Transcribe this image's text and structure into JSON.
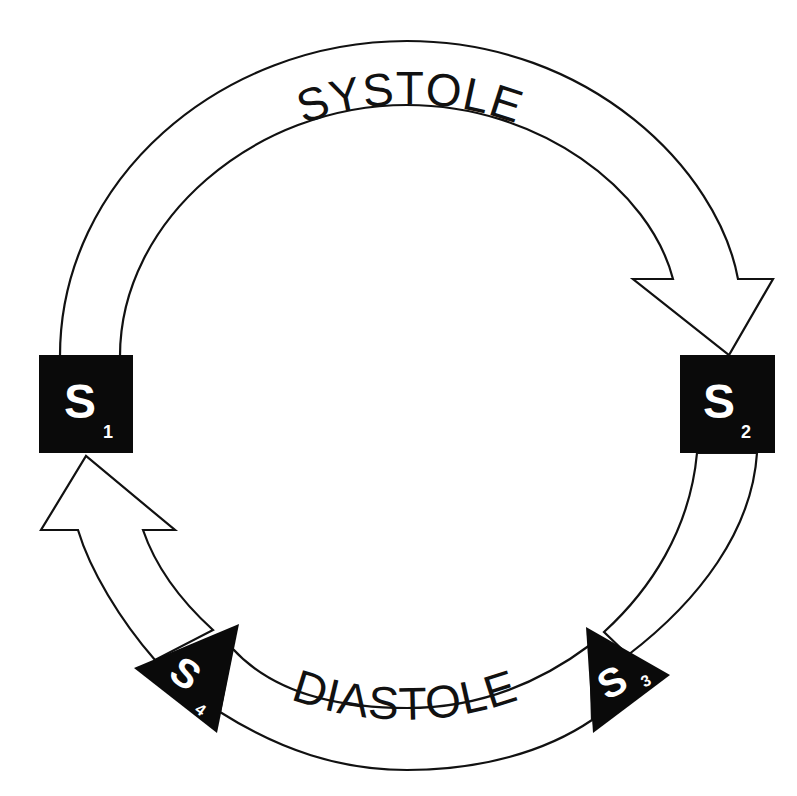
{
  "diagram": {
    "phases": {
      "systole": {
        "label": "SYSTOLE",
        "direction": "clockwise",
        "from": "S1",
        "to": "S2"
      },
      "diastole": {
        "label": "DIASTOLE",
        "from": "S2",
        "to": "S1"
      }
    },
    "nodes": [
      {
        "id": "S1",
        "letter": "S",
        "subscript": "1",
        "shape": "square",
        "position": "left"
      },
      {
        "id": "S2",
        "letter": "S",
        "subscript": "2",
        "shape": "square",
        "position": "right"
      },
      {
        "id": "S3",
        "letter": "S",
        "subscript": "3",
        "shape": "triangle",
        "position": "bottom-right"
      },
      {
        "id": "S4",
        "letter": "S",
        "subscript": "4",
        "shape": "triangle",
        "position": "bottom-left"
      }
    ],
    "colors": {
      "ink": "#111111",
      "node_fill": "#0a0a0a",
      "node_text": "#ffffff",
      "background": "#ffffff"
    }
  }
}
